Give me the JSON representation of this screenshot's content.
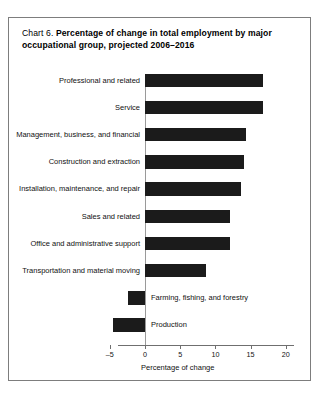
{
  "chart_data": {
    "type": "bar",
    "orientation": "horizontal",
    "title_lead": "Chart 6.",
    "title": "Percentage of change in total employment by major occupational group, projected 2006–2016",
    "xlabel": "Percentage of change",
    "ylabel": "",
    "xlim": [
      -5,
      20
    ],
    "xticks": [
      -5,
      0,
      5,
      10,
      15,
      20
    ],
    "xticklabels": [
      "–5",
      "0",
      "5",
      "10",
      "15",
      "20"
    ],
    "grid": false,
    "legend": null,
    "bar_color": "#1b1b1b",
    "categories": [
      "Professional and related",
      "Service",
      "Management, business, and financial",
      "Construction and extraction",
      "Installation, maintenance, and repair",
      "Sales and related",
      "Office and administrative support",
      "Transportation and material moving",
      "Farming, fishing, and forestry",
      "Production"
    ],
    "values": [
      16.7,
      16.7,
      14.4,
      14.0,
      13.6,
      12.1,
      12.1,
      8.6,
      -2.4,
      -4.6
    ],
    "label_side": [
      "left",
      "left",
      "left",
      "left",
      "left",
      "left",
      "left",
      "left",
      "right",
      "right"
    ]
  },
  "frame": {
    "border_color": "#7d7d7d"
  }
}
